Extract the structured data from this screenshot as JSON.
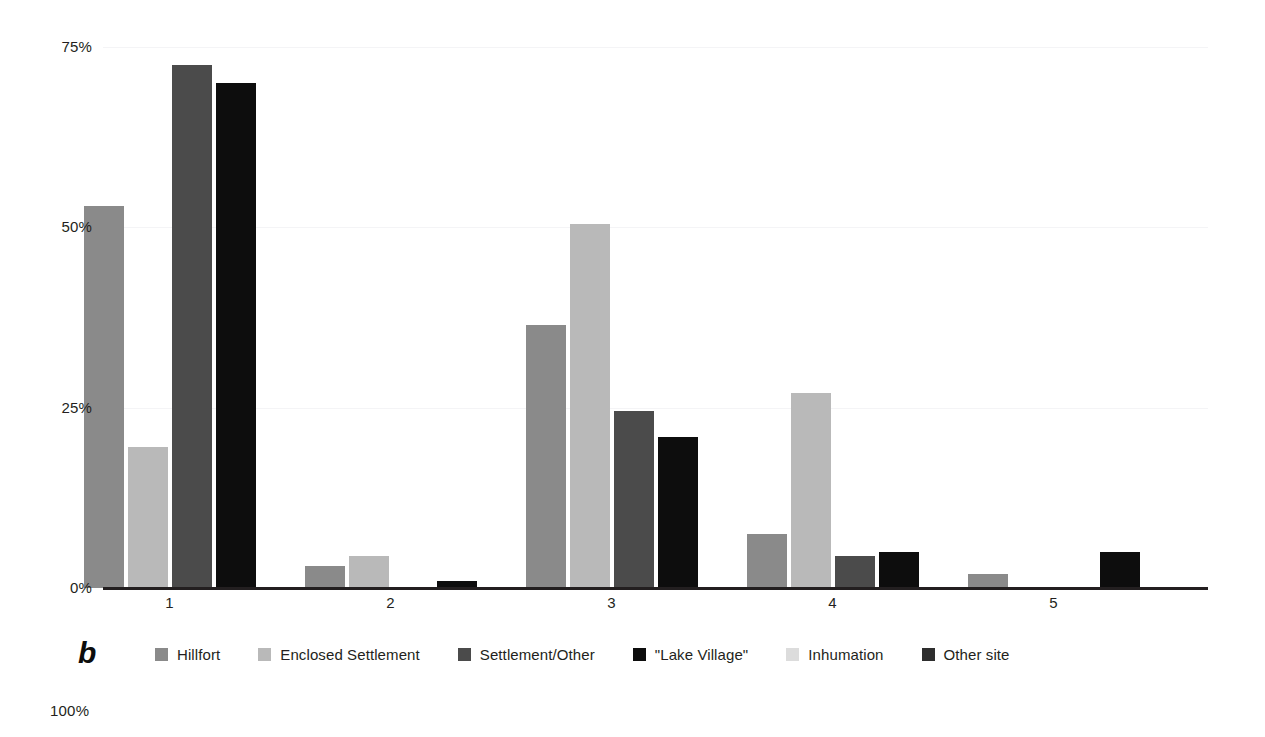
{
  "figure": {
    "panel_label": "b",
    "next_panel_axis_label": "100%"
  },
  "chart_data": {
    "type": "bar",
    "title": "",
    "subtitle": "",
    "xlabel": "",
    "ylabel": "",
    "categories": [
      "1",
      "2",
      "3",
      "4",
      "5"
    ],
    "ytick_labels": [
      "0%",
      "25%",
      "50%",
      "75%"
    ],
    "ytick_values": [
      0,
      25,
      50,
      75
    ],
    "ylim": [
      0,
      75
    ],
    "grid": true,
    "legend_position": "bottom",
    "series": [
      {
        "name": "Hillfort",
        "color": "#8a8a8a",
        "values": [
          53,
          3,
          36.5,
          7.5,
          2
        ]
      },
      {
        "name": "Enclosed Settlement",
        "color": "#b9b9b9",
        "values": [
          19.5,
          4.5,
          50.5,
          27,
          0
        ]
      },
      {
        "name": "Settlement/Other",
        "color": "#4b4b4b",
        "values": [
          72.5,
          0,
          24.5,
          4.5,
          0
        ]
      },
      {
        "name": "\"Lake Village\"",
        "color": "#0d0d0d",
        "values": [
          70,
          1,
          21,
          5,
          5
        ]
      },
      {
        "name": "Inhumation",
        "color": "#dcdcdc",
        "values": [
          0,
          0,
          0,
          0,
          0
        ]
      },
      {
        "name": "Other site",
        "color": "#2e2e2e",
        "values": [
          0,
          0,
          0,
          0,
          0
        ]
      }
    ]
  }
}
